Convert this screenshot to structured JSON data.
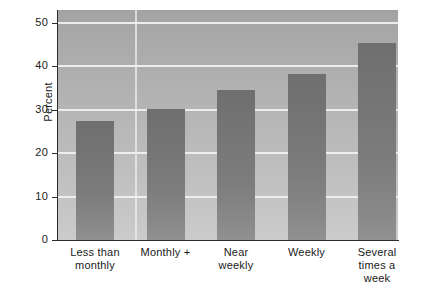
{
  "chart_data": {
    "type": "bar",
    "title": "",
    "subtitle": "",
    "xlabel": "",
    "ylabel": "Percent",
    "categories": [
      "Less than\nmonthly",
      "Monthly +",
      "Near\nweekly",
      "Weekly",
      "Several\ntimes a\nweek"
    ],
    "category_lines": [
      [
        "Less than",
        "monthly"
      ],
      [
        "Monthly +"
      ],
      [
        "Near",
        "weekly"
      ],
      [
        "Weekly"
      ],
      [
        "Several",
        "times a",
        "week"
      ]
    ],
    "values": [
      27.5,
      30.3,
      34.5,
      38.2,
      45.3
    ],
    "ylim": [
      0,
      53
    ],
    "yticks": [
      0,
      10,
      20,
      30,
      40,
      50
    ],
    "ytick_labels": [
      "0",
      "10",
      "20",
      "30",
      "40",
      "50"
    ],
    "grid": "horizontal",
    "legend": "none",
    "colors": {
      "bar_top": "#6f6f6f",
      "bar_bottom": "#919191",
      "plot_background_top": "#a3a3a3",
      "plot_background_bottom": "#cbcbcb",
      "gridline": "#f2f2f2",
      "axis": "#2b2b2b",
      "text": "#1a1a1a",
      "page_background": "#ffffff"
    }
  }
}
